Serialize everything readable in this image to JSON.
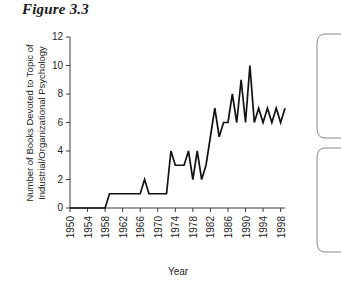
{
  "figure": {
    "title": "Figure 3.3"
  },
  "chart_data": {
    "type": "line",
    "title": "",
    "xlabel": "Year",
    "ylabel": "Number of Books Devoted to Topic of Industrial/Organizational Psychology",
    "ylabel_line1": "Number of Books Devoted to Topic of",
    "ylabel_line2": "Industrial/Organizational Psychology",
    "xlim": [
      1950,
      1999
    ],
    "ylim": [
      0,
      12
    ],
    "ytick_labels": [
      "0",
      "2",
      "4",
      "6",
      "8",
      "10",
      "12"
    ],
    "yticks": [
      0,
      2,
      4,
      6,
      8,
      10,
      12
    ],
    "xtick_labels": [
      "1950",
      "1954",
      "1958",
      "1962",
      "1966",
      "1970",
      "1974",
      "1978",
      "1982",
      "1986",
      "1990",
      "1994",
      "1998"
    ],
    "xticks": [
      1950,
      1954,
      1958,
      1962,
      1966,
      1970,
      1974,
      1978,
      1982,
      1986,
      1990,
      1994,
      1998
    ],
    "grid": false,
    "legend": false,
    "line_color": "#121212",
    "x": [
      1950,
      1951,
      1952,
      1953,
      1954,
      1955,
      1956,
      1957,
      1958,
      1959,
      1960,
      1961,
      1962,
      1963,
      1964,
      1965,
      1966,
      1967,
      1968,
      1969,
      1970,
      1971,
      1972,
      1973,
      1974,
      1975,
      1976,
      1977,
      1978,
      1979,
      1980,
      1981,
      1982,
      1983,
      1984,
      1985,
      1986,
      1987,
      1988,
      1989,
      1990,
      1991,
      1992,
      1993,
      1994,
      1995,
      1996,
      1997,
      1998,
      1999
    ],
    "values": [
      0,
      0,
      0,
      0,
      0,
      0,
      0,
      0,
      0,
      1,
      1,
      1,
      1,
      1,
      1,
      1,
      1,
      2,
      1,
      1,
      1,
      1,
      1,
      4,
      3,
      3,
      3,
      4,
      2,
      4,
      2,
      3,
      5,
      7,
      5,
      6,
      6,
      8,
      6,
      9,
      6,
      10,
      6,
      7,
      6,
      7,
      6,
      7,
      6,
      7
    ],
    "series": [
      {
        "name": "Books on I/O Psychology",
        "values": [
          0,
          0,
          0,
          0,
          0,
          0,
          0,
          0,
          0,
          1,
          1,
          1,
          1,
          1,
          1,
          1,
          1,
          2,
          1,
          1,
          1,
          1,
          1,
          4,
          3,
          3,
          3,
          4,
          2,
          4,
          2,
          3,
          5,
          7,
          5,
          6,
          6,
          8,
          6,
          9,
          6,
          10,
          6,
          7,
          6,
          7,
          6,
          7,
          6,
          7
        ]
      }
    ]
  },
  "side_panels": [
    {
      "name": "upper-callout-box"
    },
    {
      "name": "lower-callout-box"
    }
  ]
}
